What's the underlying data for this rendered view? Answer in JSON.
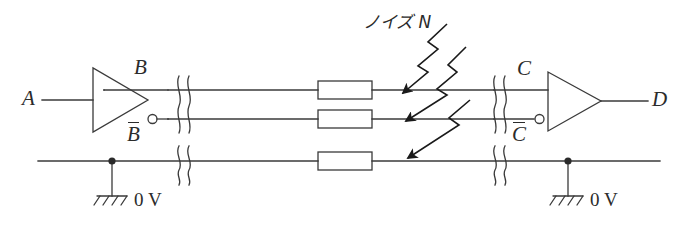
{
  "figure": {
    "type": "circuit-schematic",
    "background_color": "#ffffff",
    "line_color": "#3a3a3a",
    "text_color": "#2b2b2b"
  },
  "labels": {
    "input_a": "A",
    "output_b": "B",
    "output_b_bar": "B",
    "input_c": "C",
    "input_c_bar": "C",
    "output_d": "D",
    "noise": "ノイズ N",
    "ground_left": "0 V",
    "ground_right": "0 V"
  },
  "components": {
    "driver": {
      "name": "inverting-line-driver",
      "kind": "inverter-triangle",
      "has_bubble": true
    },
    "receiver": {
      "name": "differential-line-receiver",
      "kind": "buffer-triangle",
      "has_bubble": true
    },
    "resistors": [
      {
        "name": "resistor-top",
        "line": "B"
      },
      {
        "name": "resistor-middle",
        "line": "B-bar"
      },
      {
        "name": "resistor-bottom",
        "line": "ground"
      }
    ],
    "cable_breaks": [
      {
        "name": "cable-break-left-signal"
      },
      {
        "name": "cable-break-left-ground"
      },
      {
        "name": "cable-break-right-signal"
      },
      {
        "name": "cable-break-right-ground"
      }
    ],
    "noise_arrows": [
      {
        "name": "noise-arrow-top",
        "target_line": "B"
      },
      {
        "name": "noise-arrow-middle",
        "target_line": "B-bar"
      },
      {
        "name": "noise-arrow-bottom",
        "target_line": "ground"
      }
    ],
    "grounds": [
      {
        "name": "ground-symbol-left",
        "label": "0 V"
      },
      {
        "name": "ground-symbol-right",
        "label": "0 V"
      }
    ],
    "junctions": [
      {
        "name": "junction-dot-left"
      },
      {
        "name": "junction-dot-right"
      }
    ]
  },
  "nets": {
    "line_top": "B",
    "line_middle": "B-bar",
    "line_bottom": "0 V ground return"
  }
}
